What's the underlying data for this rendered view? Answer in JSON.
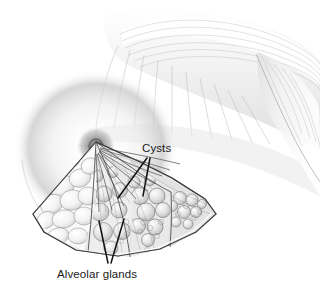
{
  "figure": {
    "style": "grayscale pencil medical illustration",
    "background_color": "#ffffff",
    "ink_color": "#1a1a1a",
    "tissue_fill": "#f2f2f2",
    "shadow_color": "#9a9a9a"
  },
  "labels": {
    "cysts": "Cysts",
    "alveolar_glands": "Alveolar glands"
  },
  "anatomy": {
    "nipple": "nipple",
    "areola": "areola",
    "ducts": "lactiferous ducts",
    "wedge": "breast tissue cutaway wedge",
    "torso": "chest and shoulder",
    "arm": "upper arm"
  },
  "leader_lines": {
    "cysts_count": 2,
    "alveolar_count": 2
  }
}
